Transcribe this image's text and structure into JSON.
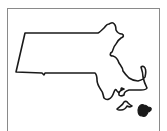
{
  "map": {
    "region": "Massachusetts",
    "stroke_color": "#1a1a1a",
    "frame_color": "#8a8a8a",
    "background": "#ffffff",
    "features": [
      {
        "name": "mainland-outline"
      },
      {
        "name": "marthas-vineyard"
      },
      {
        "name": "nantucket"
      }
    ]
  }
}
